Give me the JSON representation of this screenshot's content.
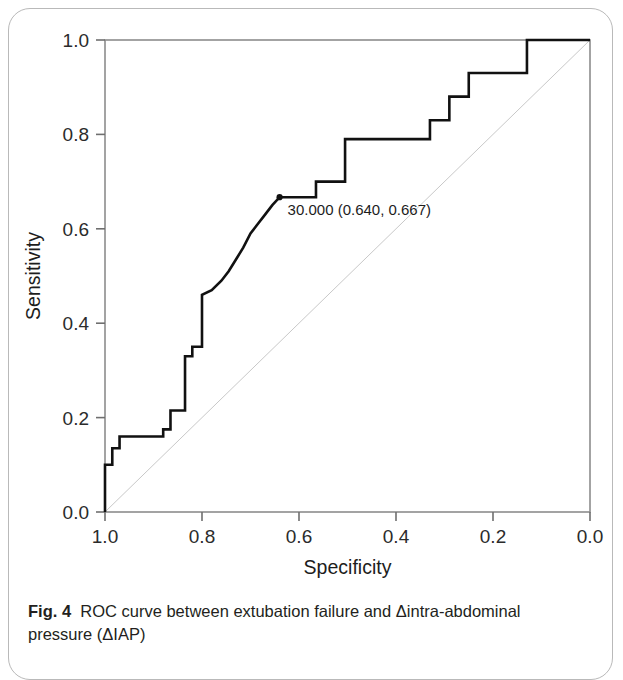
{
  "figure": {
    "caption_label": "Fig. 4",
    "caption_text": "ROC curve between extubation failure and Δintra-abdominal pressure (ΔIAP)"
  },
  "chart_data": {
    "type": "line",
    "title": "",
    "subtitle": "",
    "xlabel": "Specificity",
    "ylabel": "Sensitivity",
    "xlim": [
      1.0,
      0.0
    ],
    "ylim": [
      0.0,
      1.0
    ],
    "x_reversed": true,
    "grid": false,
    "legend": "none",
    "xticks": [
      "1.0",
      "0.8",
      "0.6",
      "0.4",
      "0.2",
      "0.0"
    ],
    "xtick_values": [
      1.0,
      0.8,
      0.6,
      0.4,
      0.2,
      0.0
    ],
    "yticks": [
      "0.0",
      "0.2",
      "0.4",
      "0.6",
      "0.8",
      "1.0"
    ],
    "ytick_values": [
      0.0,
      0.2,
      0.4,
      0.6,
      0.8,
      1.0
    ],
    "series": [
      {
        "name": "ROC curve",
        "style": "step",
        "color": "#111111",
        "width": 2.6,
        "specificity": [
          1.0,
          1.0,
          0.985,
          0.985,
          0.97,
          0.97,
          0.94,
          0.94,
          0.88,
          0.88,
          0.865,
          0.865,
          0.835,
          0.835,
          0.82,
          0.82,
          0.8,
          0.8,
          0.78,
          0.76,
          0.745,
          0.73,
          0.715,
          0.7,
          0.685,
          0.67,
          0.655,
          0.64,
          0.64,
          0.565,
          0.565,
          0.505,
          0.505,
          0.47,
          0.47,
          0.33,
          0.33,
          0.29,
          0.29,
          0.25,
          0.25,
          0.13,
          0.13,
          0.0
        ],
        "sensitivity": [
          0.0,
          0.1,
          0.1,
          0.135,
          0.135,
          0.16,
          0.16,
          0.16,
          0.16,
          0.175,
          0.175,
          0.215,
          0.215,
          0.33,
          0.33,
          0.35,
          0.35,
          0.46,
          0.47,
          0.49,
          0.51,
          0.535,
          0.56,
          0.59,
          0.61,
          0.63,
          0.65,
          0.667,
          0.667,
          0.667,
          0.7,
          0.7,
          0.79,
          0.79,
          0.79,
          0.79,
          0.83,
          0.83,
          0.88,
          0.88,
          0.93,
          0.93,
          1.0,
          1.0
        ]
      },
      {
        "name": "Reference diagonal",
        "style": "line",
        "color": "#c8c8c8",
        "width": 1.0,
        "specificity": [
          1.0,
          0.0
        ],
        "sensitivity": [
          0.0,
          1.0
        ]
      }
    ],
    "annotations": [
      {
        "label": "30.000 (0.640, 0.667)",
        "cutoff": "30.000",
        "specificity": 0.64,
        "sensitivity": 0.667,
        "marker": "dot"
      }
    ]
  }
}
